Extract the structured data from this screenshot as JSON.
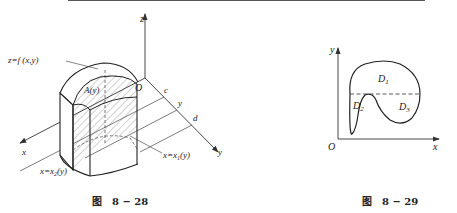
{
  "figures": [
    {
      "id": "fig-8-28",
      "caption_prefix": "图",
      "caption_number": "8 − 28",
      "axes": {
        "z": "z",
        "x": "x",
        "y": "y",
        "origin": "O"
      },
      "labels": {
        "surface": "z=f (x,y)",
        "cross_section": "A(y)",
        "y_lower": "c",
        "y_mid": "y",
        "y_upper": "d",
        "curve_x1": "x=x",
        "curve_x1_sub": "1",
        "curve_x1_arg": "(y)",
        "curve_x2": "x=x",
        "curve_x2_sub": "2",
        "curve_x2_arg": "(y)"
      }
    },
    {
      "id": "fig-8-29",
      "caption_prefix": "图",
      "caption_number": "8 − 29",
      "axes": {
        "x": "x",
        "y": "y",
        "origin": "O"
      },
      "regions": [
        {
          "name": "D",
          "sub": "1"
        },
        {
          "name": "D",
          "sub": "2"
        },
        {
          "name": "D",
          "sub": "3"
        }
      ]
    }
  ],
  "colors": {
    "ink": "#222222",
    "background": "#ffffff"
  }
}
